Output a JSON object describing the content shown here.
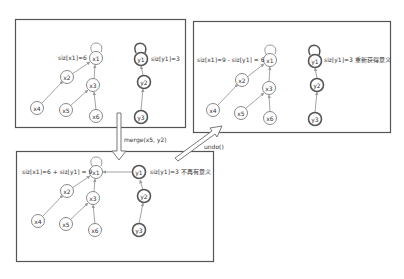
{
  "diagram": {
    "type": "union-find-undo",
    "panels": [
      {
        "id": "before",
        "size_labels": {
          "x_root": "siz[x1]=6",
          "y_root": "siz[y1]=3"
        },
        "nodes": [
          "x1",
          "x2",
          "x3",
          "x4",
          "x5",
          "x6",
          "y1",
          "y2",
          "y3"
        ],
        "edges": [
          [
            "x2",
            "x1"
          ],
          [
            "x3",
            "x1"
          ],
          [
            "x4",
            "x2"
          ],
          [
            "x5",
            "x3"
          ],
          [
            "x6",
            "x3"
          ],
          [
            "y2",
            "y1"
          ],
          [
            "y3",
            "y2"
          ]
        ]
      },
      {
        "id": "after-undo",
        "size_labels": {
          "x_root": "siz[x1]=9 - siz[y1] = 6",
          "y_root": "siz[y1]=3 重新获得意义"
        },
        "nodes": [
          "x1",
          "x2",
          "x3",
          "x4",
          "x5",
          "x6",
          "y1",
          "y2",
          "y3"
        ],
        "edges": [
          [
            "x2",
            "x1"
          ],
          [
            "x3",
            "x1"
          ],
          [
            "x4",
            "x2"
          ],
          [
            "x5",
            "x3"
          ],
          [
            "x6",
            "x3"
          ],
          [
            "y2",
            "y1"
          ],
          [
            "y3",
            "y2"
          ]
        ]
      },
      {
        "id": "after-merge",
        "size_labels": {
          "x_root": "siz[x1]=6 + siz[y1] = 9",
          "y_root": "siz[y1]=3 不再有意义"
        },
        "nodes": [
          "x1",
          "x2",
          "x3",
          "x4",
          "x5",
          "x6",
          "y1",
          "y2",
          "y3"
        ],
        "edges": [
          [
            "x2",
            "x1"
          ],
          [
            "x3",
            "x1"
          ],
          [
            "x4",
            "x2"
          ],
          [
            "x5",
            "x3"
          ],
          [
            "x6",
            "x3"
          ],
          [
            "y1",
            "x1"
          ],
          [
            "y2",
            "y1"
          ],
          [
            "y3",
            "y2"
          ]
        ]
      }
    ],
    "transitions": [
      {
        "from": "before",
        "to": "after-merge",
        "label": "merge(x5, y2)"
      },
      {
        "from": "after-merge",
        "to": "after-undo",
        "label": "undo()"
      }
    ],
    "labels": {
      "p1_x": "siz[x1]=6",
      "p1_y": "siz[y1]=3",
      "p2_x": "siz[x1]=9 - siz[y1] = 6",
      "p2_y": "siz[y1]=3 重新获得意义",
      "p3_x": "siz[x1]=6 + siz[y1] = 9",
      "p3_y": "siz[y1]=3 不再有意义",
      "merge": "merge(x5, y2)",
      "undo": "undo()"
    },
    "node_names": {
      "x1": "x1",
      "x2": "x2",
      "x3": "x3",
      "x4": "x4",
      "x5": "x5",
      "x6": "x6",
      "y1": "y1",
      "y2": "y2",
      "y3": "y3"
    },
    "colors": {
      "stroke": "#555555",
      "edge": "#999999",
      "background": "#ffffff"
    }
  }
}
